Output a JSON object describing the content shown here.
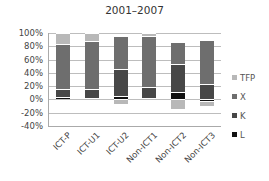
{
  "chart_data": {
    "type": "bar",
    "stacked": true,
    "title": "2001–2007",
    "xlabel": "",
    "ylabel": "",
    "ylim": [
      -40,
      100
    ],
    "yticks": [
      "100%",
      "80%",
      "60%",
      "40%",
      "20%",
      "0%",
      "-20%",
      "-40%"
    ],
    "grid": true,
    "legend_position": "right",
    "categories": [
      "ICT-P",
      "ICT-U1",
      "ICT-U2",
      "Non-ICT1",
      "Non-ICT2",
      "Non-ICT3"
    ],
    "series": [
      {
        "name": "L",
        "color": "#111111",
        "values": [
          4,
          2,
          5,
          2,
          11,
          -3
        ]
      },
      {
        "name": "K",
        "color": "#474747",
        "values": [
          12,
          14,
          41,
          16,
          42,
          23
        ]
      },
      {
        "name": "X",
        "color": "#6e6e6e",
        "values": [
          67,
          72,
          49,
          77,
          34,
          67
        ]
      },
      {
        "name": "TFP",
        "color": "#b8b8b8",
        "values": [
          17,
          12,
          -7,
          5,
          -15,
          -7
        ]
      }
    ]
  },
  "legend": [
    {
      "label": "TFP",
      "color": "#b8b8b8"
    },
    {
      "label": "X",
      "color": "#6e6e6e"
    },
    {
      "label": "K",
      "color": "#474747"
    },
    {
      "label": "L",
      "color": "#111111"
    }
  ]
}
